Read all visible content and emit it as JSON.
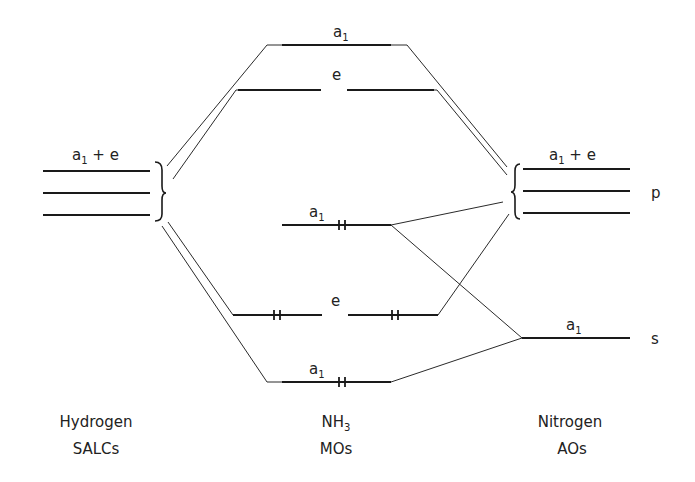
{
  "diagram": {
    "type": "molecular-orbital-energy-diagram",
    "molecule": "NH3",
    "columns": {
      "left": {
        "line1": "Hydrogen",
        "line2": "SALCs"
      },
      "center": {
        "line1_main": "NH",
        "line1_sub": "3",
        "line2": "MOs"
      },
      "right": {
        "line1": "Nitrogen",
        "line2": "AOs"
      }
    },
    "left_levels": {
      "label_main": "a",
      "label_sub": "1",
      "label_rest": " + e",
      "count": 3
    },
    "right_p_levels": {
      "label_main": "a",
      "label_sub": "1",
      "label_rest": " + e",
      "orbital": "p",
      "count": 3
    },
    "right_s_level": {
      "label_main": "a",
      "label_sub": "1",
      "orbital": "s"
    },
    "mo_levels": [
      {
        "id": "a1-antibonding",
        "label_main": "a",
        "label_sub": "1",
        "electrons": 0
      },
      {
        "id": "e-antibonding",
        "label_main": "e",
        "label_sub": "",
        "electrons": 0
      },
      {
        "id": "a1-nonbonding",
        "label_main": "a",
        "label_sub": "1",
        "electrons": 2
      },
      {
        "id": "e-bonding",
        "label_main": "e",
        "label_sub": "",
        "electrons": 4
      },
      {
        "id": "a1-bonding",
        "label_main": "a",
        "label_sub": "1",
        "electrons": 2
      }
    ]
  }
}
